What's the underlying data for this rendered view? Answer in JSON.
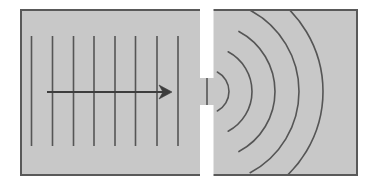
{
  "figure": {
    "canvas": {
      "width": 378,
      "height": 187,
      "background": "#ffffff"
    }
  },
  "panel": {
    "label": "diagram-panel",
    "x": 20,
    "y": 9,
    "width": 338,
    "height": 167,
    "fill": "#c8c8c8",
    "border_color": "#595959",
    "border_width": 2
  },
  "colors": {
    "panel_fill": "#c8c8c8",
    "stroke_dark": "#555555",
    "stroke_arrow": "#3d3d3d",
    "barrier_white": "#ffffff",
    "page_background": "#ffffff"
  },
  "incident_waves": {
    "label": "Incident plane wavefronts",
    "count": 8,
    "orientation": "vertical",
    "stroke": "#555555",
    "stroke_width": 1.6,
    "y_top": 36,
    "y_bottom": 146,
    "x_positions": [
      31.5,
      52.5,
      73.5,
      94,
      115,
      135.5,
      157,
      178
    ]
  },
  "direction_arrow": {
    "label": "Direction of propagation",
    "stroke": "#3d3d3d",
    "stroke_width": 2,
    "y": 92,
    "x_start": 47,
    "x_end": 172,
    "head_length": 13,
    "head_half_width": 7,
    "head_notch": 4
  },
  "barrier": {
    "label": "Opaque barrier with single slit",
    "fill": "#ffffff",
    "x": 200,
    "width": 13.5,
    "upper_segment": {
      "y": 9,
      "height": 69
    },
    "lower_segment": {
      "y": 105,
      "height": 71
    },
    "slit": {
      "label": "slit-aperture",
      "y_top": 78,
      "y_bottom": 105,
      "center_x": 207,
      "center_y": 91.5,
      "width": 27
    }
  },
  "slit_source_line": {
    "label": "Wavefront at aperture",
    "x": 207,
    "y_top": 78,
    "y_bottom": 105,
    "stroke": "#555555",
    "stroke_width": 1.6
  },
  "diffracted_waves": {
    "label": "Diffracted circular wavefronts",
    "count": 5,
    "center_x": 207,
    "center_y": 91.5,
    "stroke": "#555555",
    "stroke_width": 1.6,
    "angle_span_degrees": 124,
    "radii": [
      22,
      45,
      68,
      92,
      116
    ]
  }
}
